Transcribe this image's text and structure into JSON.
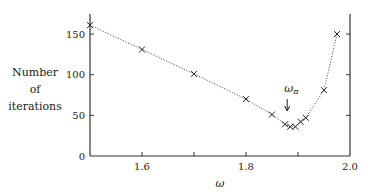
{
  "chart_data": {
    "type": "line",
    "title": "",
    "xlabel": "ω",
    "ylabel": "Number of iterations",
    "ylabel_lines": [
      "Number",
      "of",
      "iterations"
    ],
    "xlim": [
      1.5,
      2.0
    ],
    "ylim": [
      0,
      175
    ],
    "xticks": [
      1.5,
      1.6,
      1.7,
      1.8,
      1.9,
      2.0
    ],
    "xtick_labels": [
      "",
      "1.6",
      "",
      "1.8",
      "",
      "2.0"
    ],
    "yticks": [
      0,
      50,
      100,
      150
    ],
    "ytick_labels": [
      "0",
      "50",
      "100",
      "150"
    ],
    "grid": false,
    "legend": null,
    "line_style": "dotted",
    "marker": "x",
    "series": [
      {
        "name": "iterations",
        "x": [
          1.5,
          1.6,
          1.7,
          1.8,
          1.85,
          1.875,
          1.885,
          1.895,
          1.905,
          1.915,
          1.95,
          1.975
        ],
        "y": [
          161,
          131,
          101,
          70,
          51,
          39,
          36,
          36,
          42,
          47,
          81,
          150
        ]
      }
    ],
    "annotations": [
      {
        "text": "ω_π",
        "display": "ωπ",
        "x": 1.885,
        "arrow": "down"
      }
    ]
  }
}
